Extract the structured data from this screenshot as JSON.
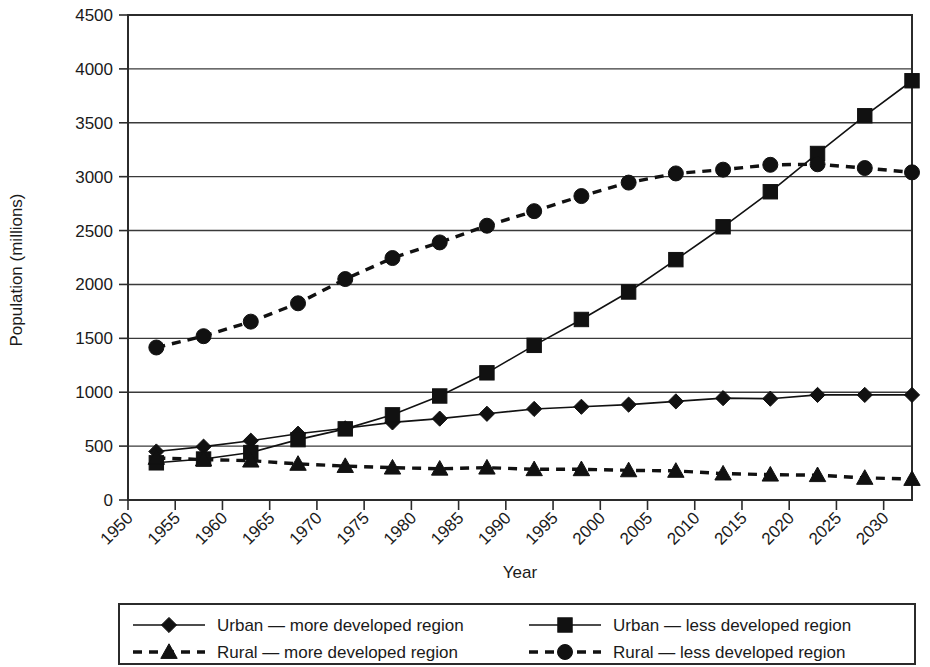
{
  "chart_data": {
    "type": "line",
    "title": "",
    "xlabel": "Year",
    "ylabel": "Population (millions)",
    "xlim": [
      1950,
      2033
    ],
    "ylim": [
      0,
      4500
    ],
    "ytick_values": [
      0,
      500,
      1000,
      1500,
      2000,
      2500,
      3000,
      3500,
      4000,
      4500
    ],
    "ytick_labels": [
      "0",
      "500",
      "1000",
      "1500",
      "2000",
      "2500",
      "3000",
      "3500",
      "4000",
      "4500"
    ],
    "xtick_values": [
      1950,
      1955,
      1960,
      1965,
      1970,
      1975,
      1980,
      1985,
      1990,
      1995,
      2000,
      2005,
      2010,
      2015,
      2020,
      2025,
      2030
    ],
    "xtick_labels": [
      "1950",
      "1955",
      "1960",
      "1965",
      "1970",
      "1975",
      "1980",
      "1985",
      "1990",
      "1995",
      "2000",
      "2005",
      "2010",
      "2015",
      "2020",
      "2025",
      "2030"
    ],
    "grid": "horizontal",
    "legend_position": "bottom",
    "x": [
      1953,
      1958,
      1963,
      1968,
      1973,
      1978,
      1983,
      1988,
      1993,
      1998,
      2003,
      2008,
      2013,
      2018,
      2023,
      2028,
      2033
    ],
    "series": [
      {
        "name": "Urban — more developed region",
        "marker": "diamond",
        "linestyle": "solid",
        "color": "#111111",
        "values": [
          450,
          495,
          550,
          615,
          665,
          720,
          755,
          800,
          845,
          865,
          885,
          915,
          945,
          940,
          975,
          975,
          975
        ]
      },
      {
        "name": "Urban — less developed region",
        "marker": "square",
        "linestyle": "solid",
        "color": "#111111",
        "values": [
          345,
          380,
          440,
          560,
          660,
          790,
          965,
          1180,
          1435,
          1675,
          1930,
          2230,
          2535,
          2860,
          3215,
          3565,
          3890
        ]
      },
      {
        "name": "Rural — more developed region",
        "marker": "triangle",
        "linestyle": "dashed",
        "color": "#111111",
        "values": [
          390,
          375,
          365,
          335,
          315,
          300,
          290,
          300,
          285,
          285,
          275,
          270,
          245,
          235,
          230,
          205,
          195
        ]
      },
      {
        "name": "Rural — less developed region",
        "marker": "circle",
        "linestyle": "dashed",
        "color": "#111111",
        "values": [
          1415,
          1520,
          1655,
          1825,
          2050,
          2245,
          2390,
          2545,
          2680,
          2820,
          2945,
          3030,
          3065,
          3110,
          3115,
          3080,
          3040
        ]
      }
    ]
  },
  "legend": {
    "entries": [
      {
        "label": "Urban — more developed region",
        "marker": "diamond",
        "linestyle": "solid"
      },
      {
        "label": "Urban — less developed region",
        "marker": "square",
        "linestyle": "solid"
      },
      {
        "label": "Rural — more developed region",
        "marker": "triangle",
        "linestyle": "dashed"
      },
      {
        "label": "Rural — less developed region",
        "marker": "circle",
        "linestyle": "dashed"
      }
    ]
  }
}
